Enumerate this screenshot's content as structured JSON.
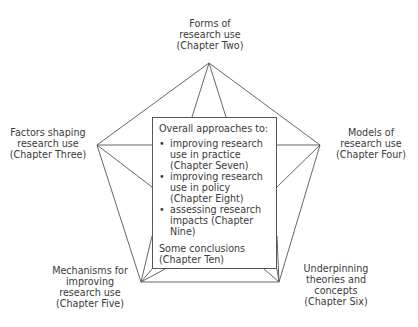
{
  "diagram": {
    "type": "pentagon-star",
    "nodes": {
      "top": {
        "lines": [
          "Forms of",
          "research use",
          "(Chapter Two)"
        ]
      },
      "left": {
        "lines": [
          "Factors shaping",
          "research use",
          "(Chapter Three)"
        ]
      },
      "right": {
        "lines": [
          "Models of",
          "research use",
          "(Chapter Four)"
        ]
      },
      "bottom_left": {
        "lines": [
          "Mechanisms for",
          "improving",
          "research use",
          "(Chapter Five)"
        ]
      },
      "bottom_right": {
        "lines": [
          "Underpinning",
          "theories and",
          "concepts",
          "(Chapter Six)"
        ]
      }
    },
    "center": {
      "heading": "Overall approaches to:",
      "items": [
        {
          "lines": [
            "improving research",
            "use in practice",
            "(Chapter Seven)"
          ]
        },
        {
          "lines": [
            "improving research",
            "use in policy",
            "(Chapter Eight)"
          ]
        },
        {
          "lines": [
            "assessing research",
            "impacts (Chapter",
            "Nine)"
          ]
        }
      ],
      "conclusion": [
        "Some conclusions",
        "(Chapter Ten)"
      ]
    },
    "colors": {
      "line": "#555555",
      "text": "#3a3a3a",
      "background": "#ffffff"
    }
  }
}
